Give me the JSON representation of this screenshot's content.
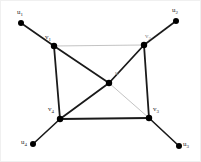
{
  "figure": {
    "kind": "graph-diagram",
    "width": 201,
    "height": 162,
    "background_color": "#ffffff",
    "border_color": "#f0f0f0"
  },
  "colors": {
    "edge_dark": "#1a1a1a",
    "edge_light": "#b4b4b4",
    "vertex_fill": "#000000",
    "label_dark": "#2b2b2b",
    "label_faint": "#8c8c8c"
  },
  "chart_data": {
    "type": "diagram",
    "title": "",
    "nodes": [
      {
        "id": "v1",
        "label": "v",
        "subscript": "1",
        "x": 53,
        "y": 45,
        "role": "cycle-vertex",
        "radius": 3.2
      },
      {
        "id": "v2",
        "label": "v",
        "subscript": "2",
        "x": 143,
        "y": 44,
        "role": "cycle-vertex",
        "radius": 3.2
      },
      {
        "id": "v3",
        "label": "v",
        "subscript": "3",
        "x": 148,
        "y": 117,
        "role": "cycle-vertex",
        "radius": 3.2
      },
      {
        "id": "v4",
        "label": "v",
        "subscript": "4",
        "x": 59,
        "y": 118,
        "role": "cycle-vertex",
        "radius": 3.2
      },
      {
        "id": "u",
        "label": "u",
        "subscript": "",
        "x": 108,
        "y": 82,
        "role": "center-vertex",
        "radius": 3.2
      },
      {
        "id": "u1",
        "label": "u",
        "subscript": "1",
        "x": 20,
        "y": 22,
        "role": "leaf-vertex",
        "radius": 3.0
      },
      {
        "id": "u2",
        "label": "u",
        "subscript": "2",
        "x": 175,
        "y": 20,
        "role": "leaf-vertex",
        "radius": 3.0
      },
      {
        "id": "u3",
        "label": "u",
        "subscript": "3",
        "x": 178,
        "y": 145,
        "role": "leaf-vertex",
        "radius": 3.0
      },
      {
        "id": "u4",
        "label": "u",
        "subscript": "4",
        "x": 32,
        "y": 143,
        "role": "leaf-vertex",
        "radius": 3.0
      }
    ],
    "edges": [
      {
        "from": "v1",
        "to": "v2",
        "style": "light",
        "width": 0.8
      },
      {
        "from": "v2",
        "to": "v3",
        "style": "dark",
        "width": 1.8
      },
      {
        "from": "v3",
        "to": "v4",
        "style": "dark",
        "width": 2.0
      },
      {
        "from": "v4",
        "to": "v1",
        "style": "dark",
        "width": 1.8
      },
      {
        "from": "u",
        "to": "v1",
        "style": "dark",
        "width": 1.8
      },
      {
        "from": "u",
        "to": "v2",
        "style": "dark",
        "width": 1.8
      },
      {
        "from": "u",
        "to": "v3",
        "style": "light",
        "width": 0.8
      },
      {
        "from": "u",
        "to": "v4",
        "style": "dark",
        "width": 1.8
      },
      {
        "from": "v1",
        "to": "u1",
        "style": "dark",
        "width": 1.6
      },
      {
        "from": "v2",
        "to": "u2",
        "style": "dark",
        "width": 1.6
      },
      {
        "from": "v3",
        "to": "u3",
        "style": "dark",
        "width": 1.6
      },
      {
        "from": "v4",
        "to": "u4",
        "style": "dark",
        "width": 1.6
      }
    ],
    "labels": [
      {
        "id": "label-u1",
        "text": "u",
        "subscript": "1",
        "x": 16,
        "y": 8,
        "tone": "dark"
      },
      {
        "id": "label-u2",
        "text": "u",
        "subscript": "2",
        "x": 171,
        "y": 6,
        "tone": "dark"
      },
      {
        "id": "label-u3",
        "text": "u",
        "subscript": "3",
        "x": 182,
        "y": 140,
        "tone": "dark"
      },
      {
        "id": "label-u4",
        "text": "u",
        "subscript": "4",
        "x": 20,
        "y": 138,
        "tone": "dark"
      },
      {
        "id": "label-v1",
        "text": "v",
        "subscript": "1",
        "x": 44,
        "y": 33,
        "tone": "dark"
      },
      {
        "id": "label-v2",
        "text": "v",
        "subscript": "2",
        "x": 144,
        "y": 32,
        "tone": "faint"
      },
      {
        "id": "label-v3",
        "text": "v",
        "subscript": "3",
        "x": 152,
        "y": 105,
        "tone": "dark"
      },
      {
        "id": "label-v4",
        "text": "v",
        "subscript": "4",
        "x": 47,
        "y": 105,
        "tone": "dark"
      },
      {
        "id": "label-u",
        "text": "u",
        "subscript": "",
        "x": 114,
        "y": 69,
        "tone": "faint"
      }
    ]
  }
}
